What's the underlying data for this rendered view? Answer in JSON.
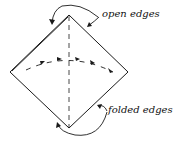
{
  "diagram": {
    "type": "origami-fold-step",
    "labels": {
      "open_edges": "open edges",
      "folded_edges": "folded edges"
    },
    "colors": {
      "stroke": "#1a1a1a",
      "background": "#ffffff"
    }
  }
}
